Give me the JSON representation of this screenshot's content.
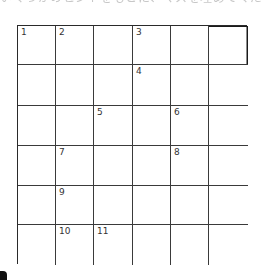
{
  "header": {
    "clipped_text": "いくつかのヒントをもとに、マスを埋めてください。"
  },
  "puzzle": {
    "rows": 6,
    "cols": 6,
    "line_color": "#3a3a3a",
    "cells": [
      [
        {
          "num": "1"
        },
        {
          "num": "2"
        },
        {
          "num": ""
        },
        {
          "num": "3"
        },
        {
          "num": ""
        },
        {
          "num": "",
          "emph": true
        }
      ],
      [
        {
          "num": ""
        },
        {
          "num": ""
        },
        {
          "num": ""
        },
        {
          "num": "4"
        },
        {
          "num": ""
        },
        {
          "num": ""
        }
      ],
      [
        {
          "num": ""
        },
        {
          "num": ""
        },
        {
          "num": "5"
        },
        {
          "num": ""
        },
        {
          "num": "6"
        },
        {
          "num": ""
        }
      ],
      [
        {
          "num": ""
        },
        {
          "num": "7"
        },
        {
          "num": ""
        },
        {
          "num": ""
        },
        {
          "num": "8"
        },
        {
          "num": ""
        }
      ],
      [
        {
          "num": ""
        },
        {
          "num": "9"
        },
        {
          "num": ""
        },
        {
          "num": ""
        },
        {
          "num": ""
        },
        {
          "num": ""
        }
      ],
      [
        {
          "num": ""
        },
        {
          "num": "10"
        },
        {
          "num": "11"
        },
        {
          "num": ""
        },
        {
          "num": ""
        },
        {
          "num": ""
        }
      ]
    ]
  }
}
